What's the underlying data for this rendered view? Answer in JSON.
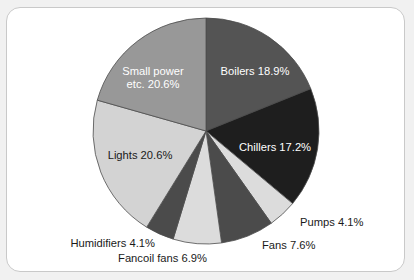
{
  "chart_data": {
    "type": "pie",
    "title": "",
    "subtitle": "",
    "xlabel": "",
    "ylabel": "",
    "legend_position": "none",
    "grid": false,
    "units": "percent",
    "start_angle_deg": 0,
    "direction": "clockwise",
    "total": 100.0,
    "categories": [
      "Boilers",
      "Chillers",
      "Pumps",
      "Fans",
      "Fancoil fans",
      "Humidifiers",
      "Lights",
      "Small power etc."
    ],
    "values": [
      18.9,
      17.2,
      4.1,
      7.6,
      6.9,
      4.1,
      20.6,
      20.6
    ],
    "slices": [
      {
        "name": "Boilers",
        "value": 18.9,
        "label": "Boilers 18.9%",
        "label_lines": [
          "Boilers 18.9%"
        ],
        "color": "#545454",
        "label_placement": "inside",
        "label_color": "#ffffff"
      },
      {
        "name": "Chillers",
        "value": 17.2,
        "label": "Chillers 17.2%",
        "label_lines": [
          "Chillers 17.2%"
        ],
        "color": "#1e1e1e",
        "label_placement": "inside",
        "label_color": "#ffffff"
      },
      {
        "name": "Pumps",
        "value": 4.1,
        "label": "Pumps 4.1%",
        "label_lines": [
          "Pumps 4.1%"
        ],
        "color": "#dcdcdc",
        "label_placement": "outside",
        "label_color": "#1a1a1a"
      },
      {
        "name": "Fans",
        "value": 7.6,
        "label": "Fans 7.6%",
        "label_lines": [
          "Fans 7.6%"
        ],
        "color": "#4b4b4b",
        "label_placement": "outside",
        "label_color": "#1a1a1a"
      },
      {
        "name": "Fancoil fans",
        "value": 6.9,
        "label": "Fancoil fans 6.9%",
        "label_lines": [
          "Fancoil fans 6.9%"
        ],
        "color": "#dcdcdc",
        "label_placement": "outside",
        "label_color": "#1a1a1a"
      },
      {
        "name": "Humidifiers",
        "value": 4.1,
        "label": "Humidifiers 4.1%",
        "label_lines": [
          "Humidifiers 4.1%"
        ],
        "color": "#4b4b4b",
        "label_placement": "outside",
        "label_color": "#1a1a1a"
      },
      {
        "name": "Lights",
        "value": 20.6,
        "label": "Lights 20.6%",
        "label_lines": [
          "Lights 20.6%"
        ],
        "color": "#d3d3d3",
        "label_placement": "inside",
        "label_color": "#1a1a1a"
      },
      {
        "name": "Small power etc.",
        "value": 20.6,
        "label": "Small power etc. 20.6%",
        "label_lines": [
          "Small power",
          "etc. 20.6%"
        ],
        "color": "#989898",
        "label_placement": "inside",
        "label_color": "#ffffff"
      }
    ]
  },
  "geometry": {
    "center_x": 199,
    "center_y": 123,
    "radius": 113
  },
  "label_positions": [
    {
      "name": "Boilers",
      "x": 248,
      "y": 64,
      "anchor": "middle"
    },
    {
      "name": "Chillers",
      "x": 268,
      "y": 140,
      "anchor": "middle"
    },
    {
      "name": "Pumps",
      "x": 293,
      "y": 215,
      "anchor": "start"
    },
    {
      "name": "Fans",
      "x": 255,
      "y": 238,
      "anchor": "start"
    },
    {
      "name": "Fancoil fans",
      "x": 200,
      "y": 251,
      "anchor": "end"
    },
    {
      "name": "Humidifiers",
      "x": 148,
      "y": 236,
      "anchor": "end"
    },
    {
      "name": "Lights",
      "x": 133,
      "y": 148,
      "anchor": "middle"
    },
    {
      "name": "Small power etc.",
      "x": 146,
      "y": 70,
      "anchor": "middle"
    }
  ],
  "colors": {
    "card_background": "#ffffff",
    "card_border": "#c9c9c9",
    "page_background": "#f1f1f1",
    "slice_outline": "#4d4d4d"
  }
}
